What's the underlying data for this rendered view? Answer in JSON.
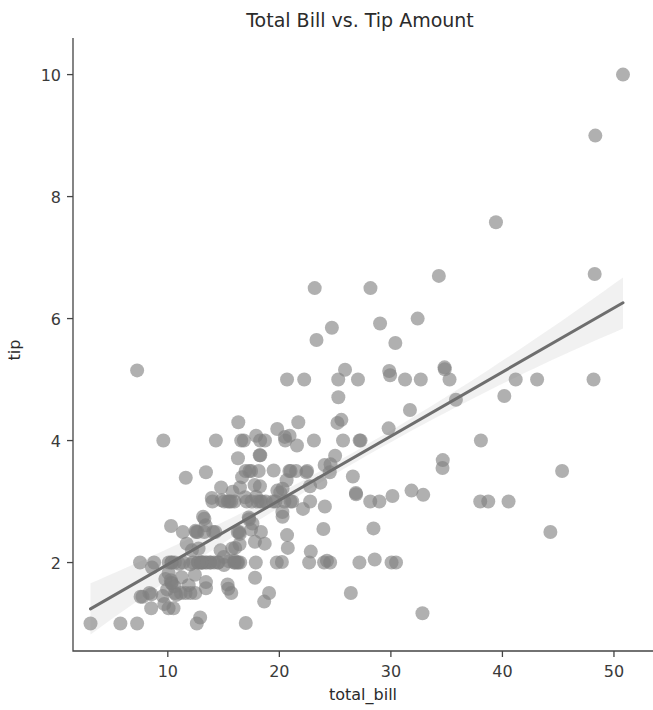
{
  "chart_data": {
    "type": "scatter",
    "title": "Total Bill vs. Tip Amount",
    "xlabel": "total_bill",
    "ylabel": "tip",
    "xlim": [
      1.5,
      53.5
    ],
    "ylim": [
      0.55,
      10.6
    ],
    "xticks": [
      10,
      20,
      30,
      40,
      50
    ],
    "yticks": [
      2,
      4,
      6,
      8,
      10
    ],
    "xtick_labels": [
      "10",
      "20",
      "30",
      "40",
      "50"
    ],
    "ytick_labels": [
      "2",
      "4",
      "6",
      "8",
      "10"
    ],
    "grid": false,
    "legend": null,
    "marker_color": "#7f7f7f",
    "marker_opacity": 0.62,
    "marker_radius": 7.0,
    "line_color": "#6e6e6e",
    "line_width": 3.0,
    "band_color": "#cccccc",
    "band_opacity": 0.28,
    "regression": {
      "slope": 0.105,
      "intercept": 0.92,
      "x_start": 3.07,
      "x_end": 50.81,
      "y_start": 1.24,
      "y_end": 6.26,
      "ci_halfwidth_center": 0.09,
      "ci_halfwidth_edge": 0.42
    },
    "x": [
      16.99,
      10.34,
      21.01,
      23.68,
      24.59,
      25.29,
      8.77,
      26.88,
      15.04,
      14.78,
      10.27,
      35.26,
      15.42,
      18.43,
      14.83,
      21.58,
      10.33,
      16.29,
      16.97,
      20.65,
      17.92,
      20.29,
      15.77,
      39.42,
      19.82,
      17.81,
      13.37,
      12.69,
      21.7,
      19.65,
      9.55,
      18.35,
      15.06,
      20.69,
      17.78,
      24.06,
      16.31,
      16.93,
      18.69,
      31.27,
      16.04,
      17.46,
      13.94,
      9.68,
      30.4,
      18.29,
      22.23,
      32.4,
      28.55,
      18.04,
      12.54,
      10.29,
      34.81,
      9.94,
      25.56,
      19.49,
      38.01,
      26.41,
      11.24,
      48.27,
      20.29,
      13.81,
      11.02,
      18.29,
      17.59,
      20.08,
      16.45,
      3.07,
      20.23,
      15.01,
      12.02,
      17.07,
      26.86,
      25.28,
      14.73,
      10.51,
      17.92,
      27.2,
      22.76,
      17.29,
      19.44,
      16.66,
      10.07,
      32.68,
      15.98,
      34.83,
      13.03,
      18.28,
      24.71,
      21.16,
      28.97,
      22.49,
      5.75,
      16.32,
      22.75,
      40.17,
      27.28,
      12.03,
      21.01,
      12.46,
      11.35,
      15.38,
      44.3,
      22.42,
      20.92,
      15.36,
      20.49,
      25.21,
      18.24,
      14.31,
      14.0,
      7.25,
      38.07,
      23.95,
      25.71,
      17.31,
      29.93,
      10.65,
      12.43,
      24.08,
      11.69,
      13.42,
      14.26,
      15.95,
      12.48,
      29.8,
      8.52,
      14.52,
      11.38,
      22.82,
      19.08,
      20.27,
      11.17,
      12.26,
      18.26,
      8.51,
      10.33,
      14.15,
      16.0,
      13.16,
      17.47,
      34.3,
      41.19,
      27.05,
      16.43,
      8.35,
      18.64,
      11.87,
      9.78,
      7.51,
      14.07,
      13.13,
      17.26,
      24.55,
      19.77,
      29.85,
      48.17,
      25.0,
      13.39,
      16.49,
      21.5,
      12.66,
      16.21,
      13.81,
      17.51,
      24.52,
      20.76,
      31.71,
      10.59,
      10.63,
      50.81,
      15.81,
      7.25,
      31.85,
      16.82,
      32.9,
      17.89,
      14.48,
      9.6,
      34.63,
      34.65,
      23.33,
      45.35,
      23.17,
      40.55,
      20.69,
      20.9,
      30.46,
      18.15,
      23.1,
      15.69,
      19.81,
      28.44,
      15.48,
      16.58,
      7.56,
      10.34,
      43.11,
      13.0,
      13.51,
      18.71,
      12.74,
      13.0,
      16.4,
      20.53,
      16.47,
      26.59,
      38.73,
      24.27,
      12.76,
      30.06,
      25.89,
      48.33,
      13.27,
      28.17,
      12.9,
      28.15,
      11.59,
      7.74,
      30.14,
      12.16,
      13.42,
      8.58,
      15.98,
      13.42,
      16.27,
      10.09,
      20.45,
      13.28,
      22.12,
      24.01,
      15.69,
      11.61,
      10.77,
      15.53,
      10.07,
      12.6,
      32.83,
      35.83,
      29.03,
      27.18,
      22.67,
      17.82,
      18.78
    ],
    "y": [
      1.01,
      1.66,
      3.5,
      3.31,
      3.61,
      4.71,
      2.0,
      3.12,
      1.96,
      3.23,
      1.71,
      5.0,
      1.57,
      3.0,
      3.02,
      3.92,
      1.67,
      3.71,
      3.5,
      3.35,
      4.08,
      2.75,
      2.23,
      7.58,
      3.18,
      2.34,
      2.0,
      2.0,
      4.3,
      3.0,
      1.45,
      2.5,
      3.0,
      2.45,
      3.27,
      3.6,
      2.0,
      3.07,
      2.31,
      5.0,
      2.24,
      2.54,
      3.06,
      1.32,
      5.6,
      3.0,
      5.0,
      6.0,
      2.05,
      3.0,
      2.5,
      2.6,
      5.2,
      1.56,
      4.34,
      3.51,
      3.0,
      1.5,
      1.76,
      6.73,
      3.21,
      2.0,
      1.98,
      3.76,
      2.64,
      3.15,
      2.47,
      1.0,
      2.01,
      2.09,
      1.97,
      3.0,
      3.14,
      5.0,
      2.2,
      1.25,
      3.08,
      4.0,
      3.0,
      2.71,
      3.0,
      3.4,
      1.83,
      5.0,
      2.03,
      5.17,
      2.0,
      4.0,
      5.85,
      3.0,
      3.0,
      3.5,
      1.0,
      4.3,
      3.25,
      4.73,
      4.0,
      1.5,
      3.0,
      1.5,
      2.5,
      3.0,
      2.5,
      3.48,
      4.08,
      1.64,
      4.06,
      4.29,
      3.76,
      4.0,
      3.0,
      1.0,
      4.0,
      2.55,
      4.0,
      3.5,
      5.07,
      1.5,
      1.8,
      2.92,
      2.31,
      1.68,
      2.5,
      2.0,
      2.52,
      4.2,
      1.48,
      2.0,
      2.0,
      2.18,
      1.5,
      2.83,
      1.5,
      2.0,
      3.25,
      1.25,
      2.0,
      2.0,
      2.0,
      2.75,
      3.5,
      6.7,
      5.0,
      5.0,
      2.3,
      1.5,
      1.36,
      1.63,
      1.73,
      2.0,
      2.5,
      2.0,
      2.74,
      2.0,
      2.0,
      5.14,
      5.0,
      3.75,
      2.61,
      2.0,
      3.5,
      2.5,
      2.0,
      2.0,
      3.0,
      3.48,
      2.24,
      4.5,
      1.61,
      2.0,
      10.0,
      3.16,
      5.15,
      3.18,
      4.0,
      3.11,
      2.0,
      2.0,
      4.0,
      3.55,
      3.68,
      5.65,
      3.5,
      6.5,
      3.0,
      5.0,
      3.5,
      2.0,
      3.5,
      4.0,
      1.5,
      4.19,
      2.56,
      2.02,
      4.0,
      1.44,
      2.0,
      5.0,
      2.0,
      2.0,
      4.0,
      2.0,
      2.0,
      2.5,
      4.0,
      3.23,
      3.41,
      3.0,
      2.03,
      2.23,
      2.0,
      5.16,
      9.0,
      2.5,
      6.5,
      1.1,
      3.0,
      1.5,
      1.44,
      3.09,
      2.2,
      3.48,
      1.92,
      3.0,
      1.58,
      2.5,
      2.0,
      3.0,
      2.72,
      2.88,
      2.0,
      3.0,
      3.39,
      1.47,
      3.0,
      1.25,
      1.0,
      1.17,
      4.67,
      5.92,
      2.0,
      2.0,
      1.75,
      3.0
    ]
  },
  "figure": {
    "title_text": "Total Bill vs. Tip Amount",
    "x_axis_title": "total_bill",
    "y_axis_title": "tip"
  }
}
